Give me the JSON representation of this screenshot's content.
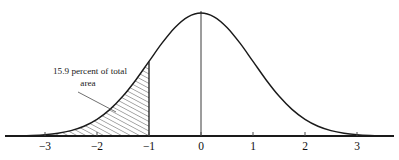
{
  "figure": {
    "background_color": "#ffffff",
    "ink_color": "#1a1a1a"
  },
  "annotation": {
    "line1": "15.9 percent of total",
    "line2": "area",
    "leader_from_x": 78,
    "leader_from_y": 92,
    "leader_to_x": 116,
    "leader_to_y": 112
  },
  "axis": {
    "tick_labels": [
      "−3",
      "−2",
      "−1",
      "0",
      "1",
      "2",
      "3"
    ],
    "tick_values": [
      -3,
      -2,
      -1,
      0,
      1,
      2,
      3
    ],
    "baseline_y": 136,
    "left_x": 5,
    "right_x": 394,
    "origin_x": 201,
    "pixels_per_unit": 52
  },
  "shading": {
    "label": "hatched-left-tail",
    "upper_bound_z": -1,
    "lower_bound_z": -3.5,
    "pattern": "diagonal-hatch",
    "percent": "15.9"
  },
  "chart_data": {
    "type": "area",
    "xlabel": "",
    "ylabel": "",
    "xlim": [
      -3.75,
      3.7
    ],
    "ylim": [
      0,
      0.4
    ],
    "grid": false,
    "legend": false,
    "distribution": "standard normal (mean 0, sd 1)",
    "xticks": [
      -3,
      -2,
      -1,
      0,
      1,
      2,
      3
    ],
    "xticklabels": [
      "−3",
      "−2",
      "−1",
      "0",
      "1",
      "2",
      "3"
    ],
    "shaded_region": {
      "from": -3.75,
      "to": -1,
      "area_percent": 15.9,
      "annotation": "15.9 percent of total area"
    },
    "center_line_at": 0,
    "x": [
      -3.75,
      -3.5,
      -3.25,
      -3.0,
      -2.75,
      -2.5,
      -2.25,
      -2.0,
      -1.75,
      -1.5,
      -1.25,
      -1.0,
      -0.75,
      -0.5,
      -0.25,
      0.0,
      0.25,
      0.5,
      0.75,
      1.0,
      1.25,
      1.5,
      1.75,
      2.0,
      2.25,
      2.5,
      2.75,
      3.0,
      3.25,
      3.5,
      3.7
    ],
    "y": [
      0.0004,
      0.0009,
      0.002,
      0.0044,
      0.0091,
      0.0175,
      0.0317,
      0.054,
      0.0863,
      0.1295,
      0.1826,
      0.242,
      0.3011,
      0.3521,
      0.3867,
      0.3989,
      0.3867,
      0.3521,
      0.3011,
      0.242,
      0.1826,
      0.1295,
      0.0863,
      0.054,
      0.0317,
      0.0175,
      0.0091,
      0.0044,
      0.002,
      0.0009,
      0.0004
    ]
  }
}
